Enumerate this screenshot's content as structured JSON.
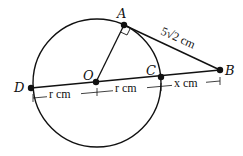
{
  "diagram": {
    "points": {
      "A": {
        "label": "A",
        "x": 124,
        "y": 25
      },
      "B": {
        "label": "B",
        "x": 220,
        "y": 70
      },
      "C": {
        "label": "C",
        "x": 161,
        "y": 77
      },
      "D": {
        "label": "D",
        "x": 31,
        "y": 88
      },
      "O": {
        "label": "O",
        "x": 96,
        "y": 82
      }
    },
    "circle": {
      "cx": 97,
      "cy": 83,
      "r": 64
    },
    "measurements": {
      "AB": "5√2 cm",
      "DO": "r cm",
      "OC": "r cm",
      "CB": "x cm"
    },
    "colors": {
      "stroke": "#111111",
      "background": "#ffffff"
    }
  }
}
